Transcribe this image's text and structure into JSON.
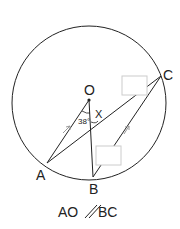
{
  "diagram": {
    "points": {
      "O": {
        "label": "O",
        "x": 89,
        "y": 100
      },
      "A": {
        "label": "A",
        "x": 47,
        "y": 163
      },
      "B": {
        "label": "B",
        "x": 93,
        "y": 177
      },
      "C": {
        "label": "C",
        "x": 161,
        "y": 76
      }
    },
    "circle": {
      "cx": 89,
      "cy": 103,
      "r": 77
    },
    "angle_label": "38°",
    "unknown_label": "X",
    "caption": "AO∥BC",
    "caption_left": "AO",
    "caption_right": "BC",
    "answer_boxes": [
      {
        "name": "answer-box-1",
        "x": 122,
        "y": 76,
        "w": 25,
        "h": 19
      },
      {
        "name": "answer-box-2",
        "x": 96,
        "y": 146,
        "w": 25,
        "h": 19
      }
    ],
    "colors": {
      "line": "#222222",
      "box_border": "#cccccc",
      "arrow": "#999999"
    }
  }
}
